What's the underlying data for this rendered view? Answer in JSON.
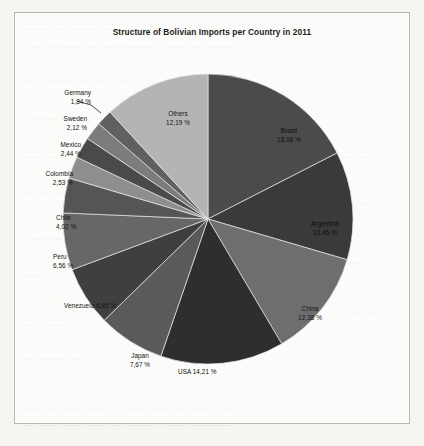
{
  "chart_data": {
    "type": "pie",
    "title": "Structure of Bolivian Imports per Country in 2011",
    "xlabel": "",
    "ylabel": "",
    "legend": "none",
    "grid": false,
    "value_suffix": " %",
    "decimal_separator": ",",
    "categories": [
      "Brasil",
      "Argentina",
      "China",
      "USA",
      "Japan",
      "Venezuela",
      "Peru",
      "Chile",
      "Colombia",
      "Mexico",
      "Sweden",
      "Germany",
      "Others"
    ],
    "values": [
      18.06,
      12.45,
      12.38,
      14.21,
      7.67,
      6.85,
      6.56,
      4.02,
      2.53,
      2.44,
      2.12,
      1.84,
      12.19
    ],
    "slices": [
      {
        "name": "Brasil",
        "pct_text": "18,06 %",
        "value": 18.06,
        "color": "#4b4b4b"
      },
      {
        "name": "Argentina",
        "pct_text": "12,45 %",
        "value": 12.45,
        "color": "#3a3a3a"
      },
      {
        "name": "China",
        "pct_text": "12,38 %",
        "value": 12.38,
        "color": "#6e6e6e"
      },
      {
        "name": "USA",
        "pct_text": "14,21 %",
        "value": 14.21,
        "color": "#2e2e2e"
      },
      {
        "name": "Japan",
        "pct_text": "7,67 %",
        "value": 7.67,
        "color": "#5a5a5a"
      },
      {
        "name": "Venezuela",
        "pct_text": "6,85 %",
        "value": 6.85,
        "color": "#3f3f3f"
      },
      {
        "name": "Peru",
        "pct_text": "6,56 %",
        "value": 6.56,
        "color": "#676767"
      },
      {
        "name": "Chile",
        "pct_text": "4,02 %",
        "value": 4.02,
        "color": "#555555"
      },
      {
        "name": "Colombia",
        "pct_text": "2,53 %",
        "value": 2.53,
        "color": "#8e8e8e"
      },
      {
        "name": "Mexico",
        "pct_text": "2,44 %",
        "value": 2.44,
        "color": "#4a4a4a"
      },
      {
        "name": "Sweden",
        "pct_text": "2,12 %",
        "value": 2.12,
        "color": "#7c7c7c"
      },
      {
        "name": "Germany",
        "pct_text": "1,84 %",
        "value": 1.84,
        "color": "#606060"
      },
      {
        "name": "Others",
        "pct_text": "12,19 %",
        "value": 12.19,
        "color": "#b4b4b4"
      }
    ]
  },
  "labels": {
    "germany_name": "Germany",
    "germany_pct": "1,84 %",
    "sweden_name": "Sweden",
    "sweden_pct": "2,12 %",
    "mexico_name": "Mexico",
    "mexico_pct": "2,44 %",
    "colombia_name": "Colombia",
    "colombia_pct": "2,53 %",
    "chile_name": "Chile",
    "chile_pct": "4,02 %",
    "peru_name": "Peru",
    "peru_pct": "6,56 %",
    "venezuela_name": "Venezuela",
    "venezuela_pct": "6,85 %",
    "japan_name": "Japan",
    "japan_pct": "7,67 %",
    "usa_name": "USA",
    "usa_pct": "14,21 %",
    "china_name": "China",
    "china_pct": "12,38 %",
    "argentina_name": "Argentina",
    "argentina_pct": "12,45 %",
    "brasil_name": "Brasil",
    "brasil_pct": "18,06 %",
    "others_name": "Others",
    "others_pct": "12,19 %"
  }
}
